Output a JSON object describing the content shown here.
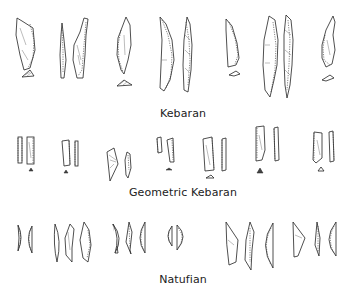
{
  "figure": {
    "groups": [
      {
        "id": "kebaran",
        "label": "Kebaran",
        "artifact_count": 9
      },
      {
        "id": "geometric-kebaran",
        "label": "Geometric Kebaran",
        "artifact_count": 14
      },
      {
        "id": "natufian",
        "label": "Natufian",
        "artifact_count": 15
      }
    ]
  }
}
